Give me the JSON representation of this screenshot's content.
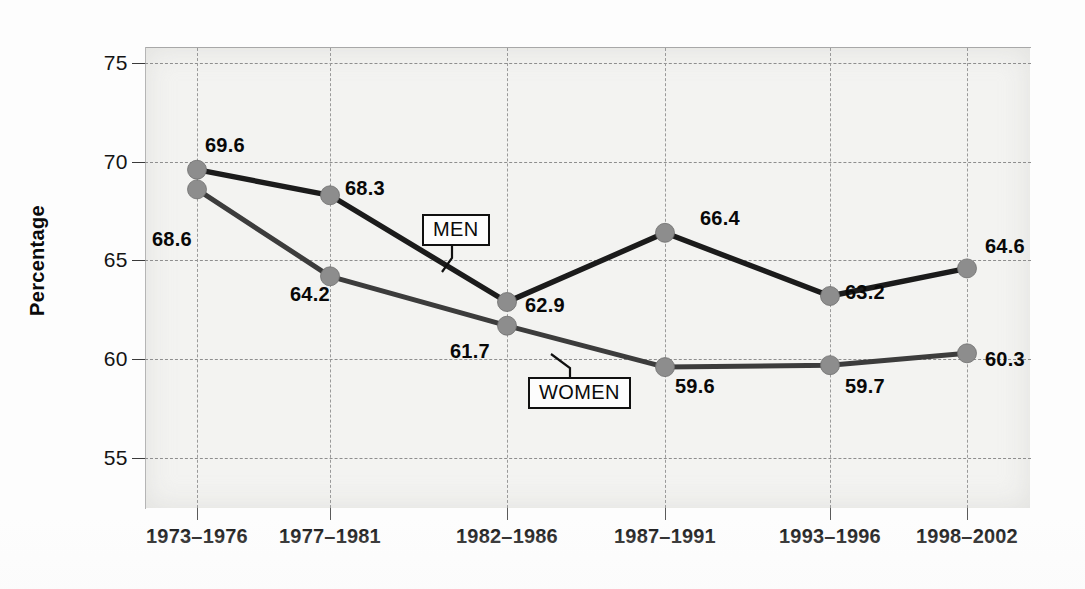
{
  "chart_data": {
    "type": "line",
    "title": "",
    "subtitle": "",
    "xlabel": "",
    "ylabel": "Percentage",
    "categories": [
      "1973–1976",
      "1977–1981",
      "1982–1986",
      "1987–1991",
      "1993–1996",
      "1998–2002"
    ],
    "series": [
      {
        "name": "MEN",
        "color": "#1b1b1b",
        "marker_color": "#8d8d8d",
        "values": [
          69.6,
          68.3,
          62.9,
          66.4,
          63.2,
          64.6
        ],
        "value_labels": [
          "69.6",
          "68.3",
          "62.9",
          "66.4",
          "63.2",
          "64.6"
        ]
      },
      {
        "name": "WOMEN",
        "color": "#3c3c3c",
        "marker_color": "#8d8d8d",
        "values": [
          68.6,
          64.2,
          61.7,
          59.6,
          59.7,
          60.3
        ],
        "value_labels": [
          "68.6",
          "64.2",
          "61.7",
          "59.6",
          "59.7",
          "60.3"
        ]
      }
    ],
    "ylim": [
      52.5,
      75.8
    ],
    "yticks": [
      75,
      70,
      65,
      60,
      55
    ],
    "ytick_labels": [
      "75",
      "70",
      "65",
      "60",
      "55"
    ],
    "grid": true,
    "grid_style": "dashed",
    "legend": "inline-callouts",
    "legend_position": "in-plot"
  },
  "axis": {
    "y_title": "Percentage",
    "y_tick_labels": [
      "75",
      "70",
      "65",
      "60",
      "55"
    ],
    "x_tick_labels": [
      "1973–1976",
      "1977–1981",
      "1982–1986",
      "1987–1991",
      "1993–1996",
      "1998–2002"
    ]
  },
  "callouts": {
    "men": "MEN",
    "women": "WOMEN"
  },
  "value_labels": {
    "men": [
      "69.6",
      "68.3",
      "62.9",
      "66.4",
      "63.2",
      "64.6"
    ],
    "women": [
      "68.6",
      "64.2",
      "61.7",
      "59.6",
      "59.7",
      "60.3"
    ]
  },
  "colors": {
    "men_line": "#1b1b1b",
    "women_line": "#3c3c3c",
    "marker": "#8d8d8d",
    "grid": "#8e8e8e",
    "plot_background": "#f3f3f1",
    "text": "#0a0a0a"
  }
}
